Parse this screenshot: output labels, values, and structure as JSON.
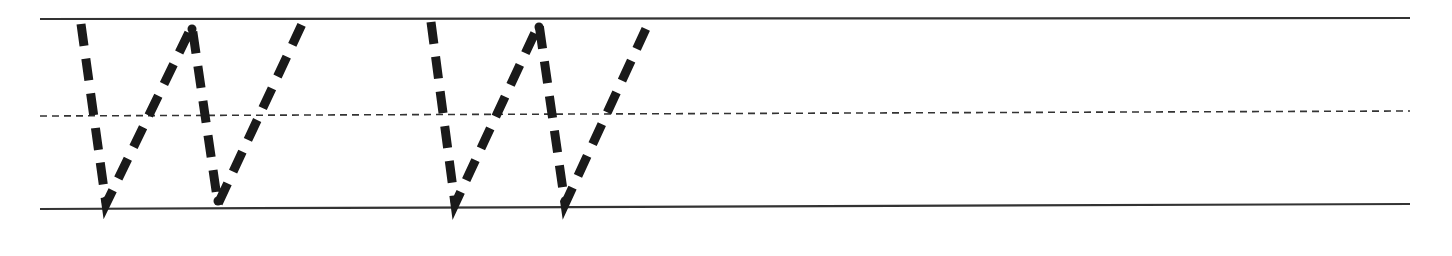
{
  "worksheet": {
    "type": "handwriting-tracing",
    "letter": "W",
    "letter_count": 2,
    "colors": {
      "background": "#ffffff",
      "ink": "#1a1a1a",
      "rule": "#333333"
    },
    "guides": {
      "x_start": 40,
      "x_end": 1410,
      "top_line": {
        "y1": 19,
        "y2": 18,
        "style": "solid",
        "width": 2.2
      },
      "mid_line": {
        "y1": 116,
        "y2": 111,
        "style": "dashed",
        "width": 1.6,
        "dash": "7,5"
      },
      "base_line": {
        "y1": 209,
        "y2": 204,
        "style": "solid",
        "width": 2.2
      }
    },
    "stroke": {
      "width": 9,
      "dash": "22,13"
    },
    "letters": [
      {
        "name": "W-1",
        "points": [
          [
            81,
            24
          ],
          [
            106,
            204
          ],
          [
            192,
            26
          ],
          [
            218,
            204
          ],
          [
            302,
            24
          ]
        ]
      },
      {
        "name": "W-2",
        "points": [
          [
            431,
            22
          ],
          [
            455,
            204
          ],
          [
            539,
            24
          ],
          [
            565,
            204
          ],
          [
            649,
            22
          ]
        ]
      }
    ]
  }
}
